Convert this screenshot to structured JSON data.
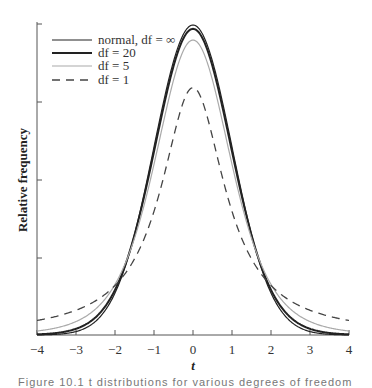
{
  "chart_data": {
    "type": "line",
    "title": "",
    "xlabel": "t",
    "ylabel": "Relative frequency",
    "xlim": [
      -4,
      4
    ],
    "ylim": [
      0,
      0.4
    ],
    "x_ticks": [
      "−4",
      "−3",
      "−2",
      "−1",
      "0",
      "1",
      "2",
      "3",
      "4"
    ],
    "y_ticks_unlabeled": [
      0.1,
      0.2,
      0.3,
      0.4
    ],
    "grid": false,
    "legend_position": "upper-left",
    "series": [
      {
        "name": "normal, df = ∞",
        "style": "solid-dark-thin",
        "peak": 0.399
      },
      {
        "name": "df = 20",
        "style": "solid-dark-thick",
        "peak": 0.394
      },
      {
        "name": "df = 5",
        "style": "solid-light",
        "peak": 0.38
      },
      {
        "name": "df = 1",
        "style": "dashed",
        "peak": 0.318
      }
    ],
    "x": [
      -4,
      -3,
      -2,
      -1,
      0,
      1,
      2,
      3,
      4
    ],
    "values_by_series": {
      "normal, df = ∞": [
        0.0001,
        0.0044,
        0.054,
        0.242,
        0.399,
        0.242,
        0.054,
        0.0044,
        0.0001
      ],
      "df = 20": [
        0.0006,
        0.0079,
        0.061,
        0.236,
        0.394,
        0.236,
        0.061,
        0.0079,
        0.0006
      ],
      "df = 5": [
        0.0051,
        0.0173,
        0.065,
        0.22,
        0.38,
        0.22,
        0.065,
        0.0173,
        0.0051
      ],
      "df = 1": [
        0.0187,
        0.0318,
        0.064,
        0.159,
        0.318,
        0.159,
        0.064,
        0.0318,
        0.0187
      ]
    }
  },
  "legend": {
    "items": [
      {
        "label": "normal, df = ∞"
      },
      {
        "label": "df = 20"
      },
      {
        "label": "df = 5"
      },
      {
        "label": "df = 1"
      }
    ]
  },
  "axes": {
    "x_label": "t",
    "y_label": "Relative frequency",
    "x_ticks": [
      "−4",
      "−3",
      "−2",
      "−1",
      "0",
      "1",
      "2",
      "3",
      "4"
    ]
  },
  "caption": "Figure 10.1 t distributions for various degrees of freedom"
}
